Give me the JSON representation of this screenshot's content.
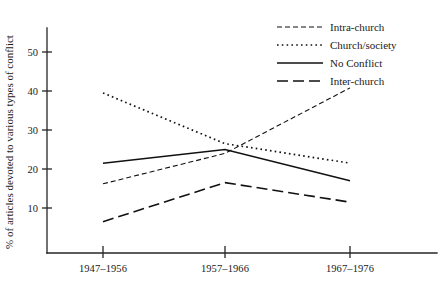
{
  "chart_data": {
    "type": "line",
    "title": "",
    "xlabel": "",
    "ylabel": "% of articles devoted to various types of conflict",
    "categories": [
      "1947–1956",
      "1957–1966",
      "1967–1976"
    ],
    "yticks": [
      "10",
      "20",
      "30",
      "40",
      "50"
    ],
    "ytick_values": [
      10,
      20,
      30,
      40,
      50
    ],
    "ylim": [
      0,
      57
    ],
    "grid": false,
    "legend_position": "top-right",
    "series": [
      {
        "name": "Intra-church",
        "values": [
          16.2,
          24.0,
          40.8
        ],
        "style": "dashed",
        "dasharray": "5,3",
        "width": 1.1
      },
      {
        "name": "Church/society",
        "values": [
          39.5,
          26.5,
          21.5
        ],
        "style": "dotted",
        "dasharray": "1.6,3.2",
        "width": 1.7
      },
      {
        "name": "No Conflict",
        "values": [
          21.5,
          25.0,
          17.0
        ],
        "style": "solid",
        "dasharray": "none",
        "width": 1.5
      },
      {
        "name": "Inter-church",
        "values": [
          6.5,
          16.5,
          11.5
        ],
        "style": "long-dashed",
        "dasharray": "11,5",
        "width": 1.6
      }
    ]
  },
  "colors": {
    "axis": "#262626",
    "line": "#111111",
    "background": "#ffffff",
    "text": "#1a1a1a"
  },
  "geometry": {
    "x_positions": [
      103,
      225,
      350
    ],
    "y_zero": 247,
    "px_per_unit": 3.9,
    "axis_left": 47,
    "axis_bottom": 253,
    "axis_top": 28,
    "axis_right": 437,
    "legend_x_line_start": 277,
    "legend_x_line_end": 323,
    "legend_x_text": 330,
    "legend_y_start": 27,
    "legend_y_step": 18
  }
}
